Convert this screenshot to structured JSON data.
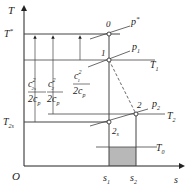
{
  "diagram": {
    "type": "T-s thermodynamic diagram",
    "axes": {
      "x_label": "s",
      "y_label": "T",
      "origin_label": "O",
      "x_ticks": [
        "s1",
        "s2"
      ],
      "y_ticks": [
        "T*",
        "T2s"
      ]
    },
    "points": [
      {
        "id": "0",
        "label": "0"
      },
      {
        "id": "1",
        "label": "1"
      },
      {
        "id": "2",
        "label": "2"
      },
      {
        "id": "2s",
        "label": "2s"
      }
    ],
    "isobars": [
      {
        "label": "p*"
      },
      {
        "label": "p1"
      },
      {
        "label": "p2"
      }
    ],
    "isotherms": [
      {
        "label": "T1"
      },
      {
        "label": "T2"
      },
      {
        "label": "T0"
      }
    ],
    "annotations": {
      "c2s": {
        "num": "c",
        "num_sup": "2",
        "num_sub": "2s",
        "den": "2c",
        "den_sub": "p"
      },
      "c2": {
        "num": "c",
        "num_sup": "2",
        "num_sub": "2",
        "den": "2c",
        "den_sub": "p"
      },
      "c1": {
        "num": "c",
        "num_sup": "2",
        "num_sub": "1",
        "den": "2c",
        "den_sub": "p"
      }
    },
    "shaded_region": "area between s1 and s2 below T0",
    "colors": {
      "line": "#333333",
      "shade": "#b8b8b8"
    }
  }
}
